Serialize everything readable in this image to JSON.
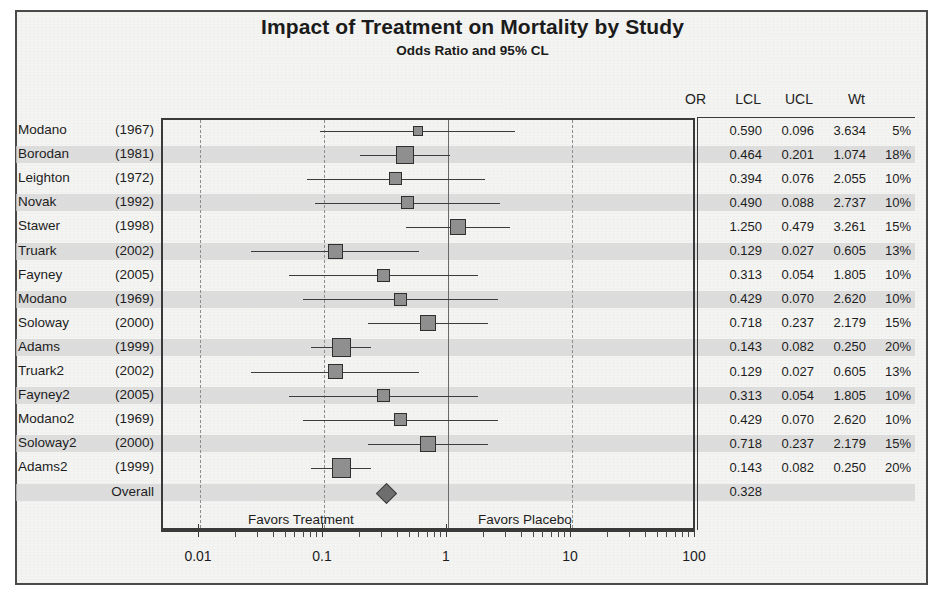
{
  "chart_data": {
    "type": "forest",
    "title": "Impact of Treatment on Mortality by Study",
    "subtitle": "Odds Ratio and 95% CL",
    "xlabel": "",
    "ylabel": "",
    "xscale": "log",
    "xlim": [
      0.01,
      100
    ],
    "x_ticks": [
      "0.01",
      "0.1",
      "1",
      "10",
      "100"
    ],
    "x_tick_values": [
      0.01,
      0.1,
      1,
      10,
      100
    ],
    "reference_line": 1,
    "grid": "vertical dashed at 0.01, 0.1, 10, 100; solid at 1",
    "legend": "none",
    "columns": [
      "OR",
      "LCL",
      "UCL",
      "Wt"
    ],
    "favors_left": "Favors Treatment",
    "favors_right": "Favors Placebo",
    "rows": [
      {
        "study": "Modano",
        "year": "(1967)",
        "or": "0.590",
        "lcl": "0.096",
        "ucl": "3.634",
        "wt": "5%",
        "or_v": 0.59,
        "lcl_v": 0.096,
        "ucl_v": 3.634,
        "wt_v": 5
      },
      {
        "study": "Borodan",
        "year": "(1981)",
        "or": "0.464",
        "lcl": "0.201",
        "ucl": "1.074",
        "wt": "18%",
        "or_v": 0.464,
        "lcl_v": 0.201,
        "ucl_v": 1.074,
        "wt_v": 18
      },
      {
        "study": "Leighton",
        "year": "(1972)",
        "or": "0.394",
        "lcl": "0.076",
        "ucl": "2.055",
        "wt": "10%",
        "or_v": 0.394,
        "lcl_v": 0.076,
        "ucl_v": 2.055,
        "wt_v": 10
      },
      {
        "study": "Novak",
        "year": "(1992)",
        "or": "0.490",
        "lcl": "0.088",
        "ucl": "2.737",
        "wt": "10%",
        "or_v": 0.49,
        "lcl_v": 0.088,
        "ucl_v": 2.737,
        "wt_v": 10
      },
      {
        "study": "Stawer",
        "year": "(1998)",
        "or": "1.250",
        "lcl": "0.479",
        "ucl": "3.261",
        "wt": "15%",
        "or_v": 1.25,
        "lcl_v": 0.479,
        "ucl_v": 3.261,
        "wt_v": 15
      },
      {
        "study": "Truark",
        "year": "(2002)",
        "or": "0.129",
        "lcl": "0.027",
        "ucl": "0.605",
        "wt": "13%",
        "or_v": 0.129,
        "lcl_v": 0.027,
        "ucl_v": 0.605,
        "wt_v": 13
      },
      {
        "study": "Fayney",
        "year": "(2005)",
        "or": "0.313",
        "lcl": "0.054",
        "ucl": "1.805",
        "wt": "10%",
        "or_v": 0.313,
        "lcl_v": 0.054,
        "ucl_v": 1.805,
        "wt_v": 10
      },
      {
        "study": "Modano",
        "year": "(1969)",
        "or": "0.429",
        "lcl": "0.070",
        "ucl": "2.620",
        "wt": "10%",
        "or_v": 0.429,
        "lcl_v": 0.07,
        "ucl_v": 2.62,
        "wt_v": 10
      },
      {
        "study": "Soloway",
        "year": "(2000)",
        "or": "0.718",
        "lcl": "0.237",
        "ucl": "2.179",
        "wt": "15%",
        "or_v": 0.718,
        "lcl_v": 0.237,
        "ucl_v": 2.179,
        "wt_v": 15
      },
      {
        "study": "Adams",
        "year": "(1999)",
        "or": "0.143",
        "lcl": "0.082",
        "ucl": "0.250",
        "wt": "20%",
        "or_v": 0.143,
        "lcl_v": 0.082,
        "ucl_v": 0.25,
        "wt_v": 20
      },
      {
        "study": "Truark2",
        "year": "(2002)",
        "or": "0.129",
        "lcl": "0.027",
        "ucl": "0.605",
        "wt": "13%",
        "or_v": 0.129,
        "lcl_v": 0.027,
        "ucl_v": 0.605,
        "wt_v": 13
      },
      {
        "study": "Fayney2",
        "year": "(2005)",
        "or": "0.313",
        "lcl": "0.054",
        "ucl": "1.805",
        "wt": "10%",
        "or_v": 0.313,
        "lcl_v": 0.054,
        "ucl_v": 1.805,
        "wt_v": 10
      },
      {
        "study": "Modano2",
        "year": "(1969)",
        "or": "0.429",
        "lcl": "0.070",
        "ucl": "2.620",
        "wt": "10%",
        "or_v": 0.429,
        "lcl_v": 0.07,
        "ucl_v": 2.62,
        "wt_v": 10
      },
      {
        "study": "Soloway2",
        "year": "(2000)",
        "or": "0.718",
        "lcl": "0.237",
        "ucl": "2.179",
        "wt": "15%",
        "or_v": 0.718,
        "lcl_v": 0.237,
        "ucl_v": 2.179,
        "wt_v": 15
      },
      {
        "study": "Adams2",
        "year": "(1999)",
        "or": "0.143",
        "lcl": "0.082",
        "ucl": "0.250",
        "wt": "20%",
        "or_v": 0.143,
        "lcl_v": 0.082,
        "ucl_v": 0.25,
        "wt_v": 20
      },
      {
        "study": "Overall",
        "year": "",
        "or": "0.328",
        "lcl": "",
        "ucl": "",
        "wt": "",
        "or_v": 0.328,
        "lcl_v": null,
        "ucl_v": null,
        "wt_v": null,
        "summary": true
      }
    ]
  },
  "colors": {
    "marker_fill": "#8f8f8f",
    "marker_edge": "#2f2f2f",
    "band": "#d4d4d4",
    "text": "#1d1d1d",
    "frame": "#4a4a4a",
    "gridline": "#8d8d8d"
  }
}
